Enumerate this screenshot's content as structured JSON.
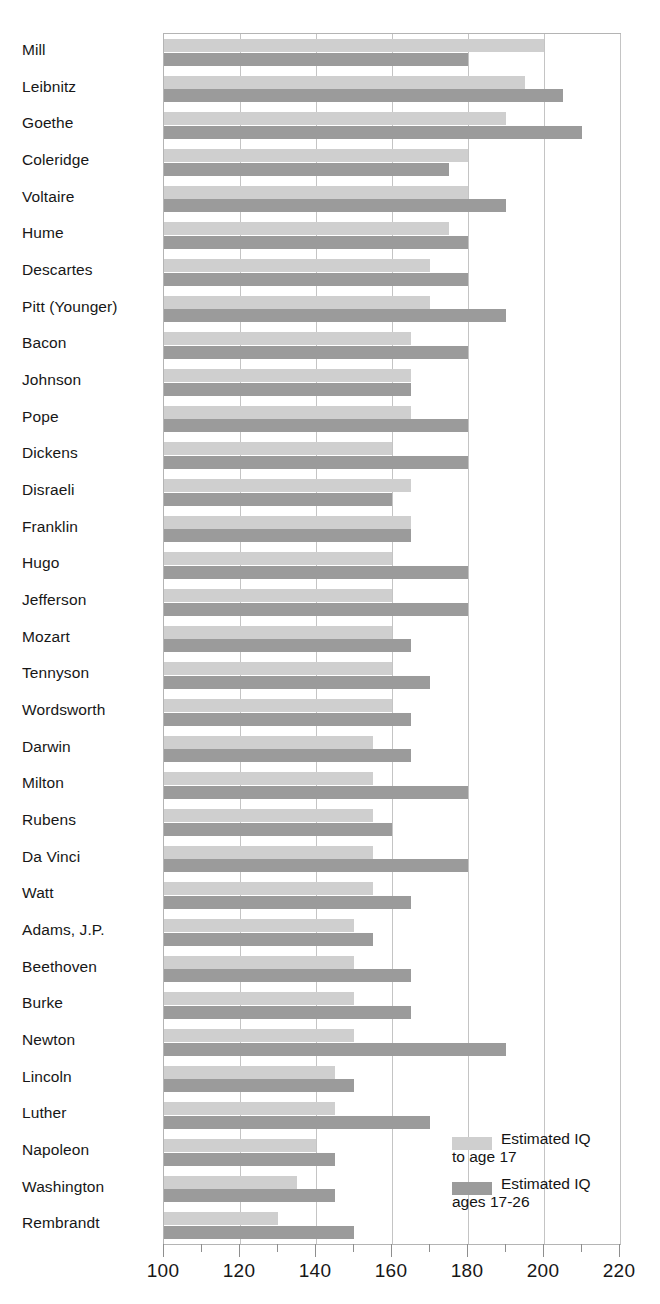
{
  "chart_data": {
    "type": "bar",
    "orientation": "horizontal",
    "title": "",
    "xlabel": "",
    "ylabel": "",
    "xlim": [
      100,
      220
    ],
    "xticks": [
      100,
      120,
      140,
      160,
      180,
      200,
      220
    ],
    "xtick_labels": [
      "100",
      "120",
      "140",
      "160",
      "180",
      "200",
      "220"
    ],
    "minor_tick_step": 10,
    "grid": true,
    "grid_axis": "x",
    "legend_position": "bottom-right",
    "categories": [
      "Mill",
      "Leibnitz",
      "Goethe",
      "Coleridge",
      "Voltaire",
      "Hume",
      "Descartes",
      "Pitt (Younger)",
      "Bacon",
      "Johnson",
      "Pope",
      "Dickens",
      "Disraeli",
      "Franklin",
      "Hugo",
      "Jefferson",
      "Mozart",
      "Tennyson",
      "Wordsworth",
      "Darwin",
      "Milton",
      "Rubens",
      "Da Vinci",
      "Watt",
      "Adams, J.P.",
      "Beethoven",
      "Burke",
      "Newton",
      "Lincoln",
      "Luther",
      "Napoleon",
      "Washington",
      "Rembrandt"
    ],
    "series": [
      {
        "name": "Estimated IQ\nto age 17",
        "color": "#cfcfcf",
        "values": [
          200,
          195,
          190,
          180,
          180,
          175,
          170,
          170,
          165,
          165,
          165,
          160,
          165,
          165,
          160,
          160,
          160,
          160,
          160,
          155,
          155,
          155,
          155,
          155,
          150,
          150,
          150,
          150,
          145,
          145,
          140,
          135,
          130
        ]
      },
      {
        "name": "Estimated IQ\nages 17-26",
        "color": "#9b9b9b",
        "values": [
          180,
          205,
          210,
          175,
          190,
          180,
          180,
          190,
          180,
          165,
          180,
          180,
          160,
          165,
          180,
          180,
          165,
          170,
          165,
          165,
          180,
          160,
          180,
          165,
          155,
          165,
          165,
          190,
          150,
          170,
          145,
          145,
          150
        ]
      }
    ]
  },
  "legend": {
    "entries": [
      {
        "label": "Estimated IQ\nto age 17",
        "swatch": "light"
      },
      {
        "label": "Estimated IQ\nages 17-26",
        "swatch": "dark"
      }
    ]
  },
  "colors": {
    "series_light": "#cfcfcf",
    "series_dark": "#9b9b9b",
    "grid": "#c4c4c4",
    "axis": "#b4b4b4",
    "text": "#171717",
    "background": "#ffffff"
  }
}
